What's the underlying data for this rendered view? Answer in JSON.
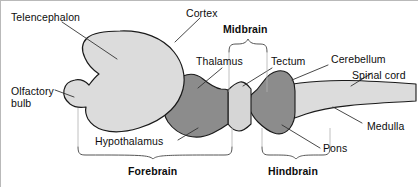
{
  "figure": {
    "background_color": "#ffffff",
    "line_color": "#1a1a1a",
    "text_color": "#0d0d0d"
  },
  "colors": {
    "light_gray_fill": "#dcdcdc",
    "dark_gray_fill": "#8c8c8c",
    "midbrain_fill": "#d6d6d6",
    "outline": "#1a1a1a",
    "leader_line": "#333333",
    "bracket": "#555555"
  },
  "labels": {
    "telencephalon": "Telencephalon",
    "cortex": "Cortex",
    "midbrain": "Midbrain",
    "thalamus": "Thalamus",
    "tectum": "Tectum",
    "cerebellum": "Cerebellum",
    "spinal_cord": "Spinal cord",
    "olfactory_bulb": "Olfactory bulb",
    "medulla": "Medulla",
    "hypothalamus": "Hypothalamus",
    "pons": "Pons",
    "forebrain": "Forebrain",
    "hindbrain": "Hindbrain"
  },
  "brackets": [
    {
      "name": "midbrain",
      "label": "Midbrain",
      "orientation": "up",
      "x_start": 228,
      "x_end": 268,
      "y": 40
    },
    {
      "name": "forebrain",
      "label": "Forebrain",
      "orientation": "down",
      "x_start": 78,
      "x_end": 232,
      "y": 158
    },
    {
      "name": "hindbrain",
      "label": "Hindbrain",
      "orientation": "down",
      "x_start": 262,
      "x_end": 330,
      "y": 158
    }
  ],
  "regions": [
    {
      "name": "telencephalon",
      "shade": "light",
      "label": "Telencephalon"
    },
    {
      "name": "olfactory-bulb",
      "shade": "light",
      "label": "Olfactory bulb"
    },
    {
      "name": "thalamus-hypothalamus",
      "shade": "dark",
      "label": "Thalamus / Hypothalamus"
    },
    {
      "name": "tectum",
      "shade": "light",
      "label": "Tectum"
    },
    {
      "name": "cerebellum-pons",
      "shade": "dark",
      "label": "Cerebellum / Pons"
    },
    {
      "name": "medulla-spinal-cord",
      "shade": "light",
      "label": "Medulla / Spinal cord"
    }
  ]
}
